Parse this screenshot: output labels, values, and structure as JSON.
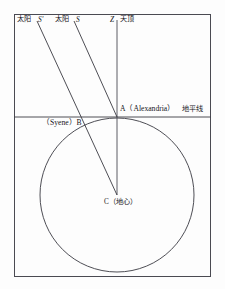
{
  "figure": {
    "title_alt": "Eratosthenes measurement of the Earth diagram",
    "frame": {
      "x": 14,
      "y": 14,
      "width": 197,
      "height": 263
    },
    "colors": {
      "ink": "#15151a",
      "line": "#3a3a42",
      "background": "#fdfdfd"
    },
    "labels": {
      "sun_left": "太阳",
      "sun_ray_left": "S'",
      "sun_right": "太阳",
      "sun_ray_right": "S",
      "zenith_letter": "Z",
      "zenith_word": "天顶",
      "alexandria": "A（Alexandria）",
      "horizon": "地平线",
      "syene": "（Syene）B",
      "center": "C（地心）"
    },
    "geometry": {
      "horizon_line_y": 117,
      "earth_center": {
        "x": 117,
        "y": 195
      },
      "earth_radius": 77,
      "point_a": {
        "x": 117,
        "y": 117
      },
      "point_b": {
        "x": 89.5,
        "y": 123.5
      },
      "zenith_line": {
        "x": 117,
        "y_top": 20,
        "y_bottom": 195
      },
      "ray_to_a": {
        "x1": 74,
        "y1": 20,
        "x2": 117,
        "y2": 117
      },
      "ray_to_c": {
        "x1": 37,
        "y1": 20,
        "x2": 117,
        "y2": 195
      }
    }
  }
}
